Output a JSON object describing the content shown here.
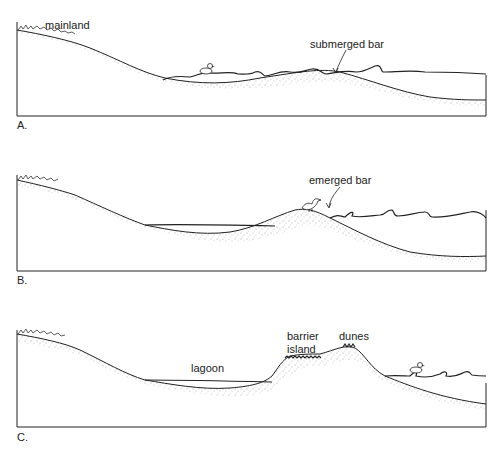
{
  "panels": [
    {
      "id": "A",
      "letter": "A.",
      "labels": {
        "mainland": "mainland",
        "bar": "submerged bar"
      }
    },
    {
      "id": "B",
      "letter": "B.",
      "labels": {
        "bar": "emerged bar"
      }
    },
    {
      "id": "C",
      "letter": "C.",
      "labels": {
        "lagoon": "lagoon",
        "barrier_line1": "barrier",
        "barrier_line2": "island",
        "dunes": "dunes"
      }
    }
  ],
  "colors": {
    "line": "#222222",
    "sand_dots": "#555555",
    "background": "#ffffff"
  }
}
